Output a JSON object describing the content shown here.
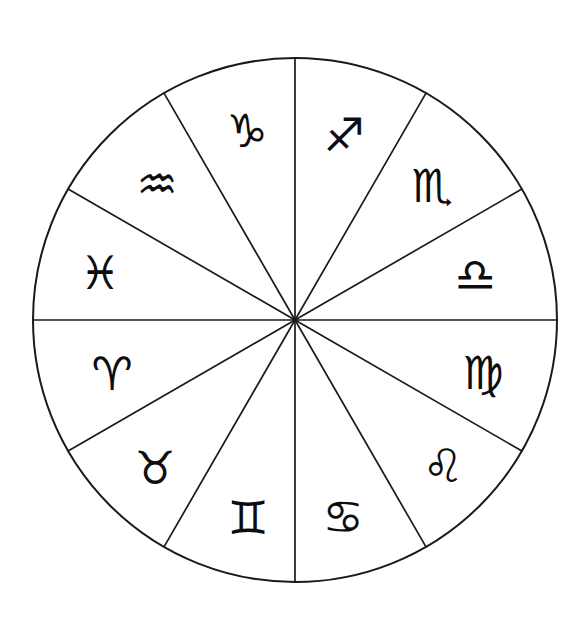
{
  "diagram": {
    "background_color": "#ffffff",
    "line_color": "#1a1a1a",
    "glyph_color": "#0d0d0d",
    "center_x": 295,
    "center_y": 320,
    "radius": 262,
    "segment_count": 12,
    "segment_span_degrees": 30,
    "glyph_radius": 192
  },
  "chart_data": {
    "type": "pie",
    "xlabel": "",
    "ylabel": "",
    "categories": [
      "Sagittarius",
      "Scorpio",
      "Libra",
      "Virgo",
      "Leo",
      "Cancer",
      "Gemini",
      "Taurus",
      "Aries",
      "Pisces",
      "Aquarius",
      "Capricorn"
    ],
    "values": [
      30,
      30,
      30,
      30,
      30,
      30,
      30,
      30,
      30,
      30,
      30,
      30
    ],
    "legend_position": "none",
    "grid": false
  },
  "segments": [
    {
      "name": "Sagittarius",
      "glyph": "♐",
      "icon_name": "sagittarius-archer-icon",
      "start_angle": 270,
      "end_angle": 300,
      "mid_angle": 285,
      "glyph_x": 344,
      "glyph_y": 135,
      "glyph_size": 46,
      "glyph_rotation": 0
    },
    {
      "name": "Scorpio",
      "glyph": "♏",
      "icon_name": "scorpio-scorpion-icon",
      "start_angle": 300,
      "end_angle": 330,
      "mid_angle": 315,
      "glyph_x": 432,
      "glyph_y": 186,
      "glyph_size": 46,
      "glyph_rotation": 0
    },
    {
      "name": "Libra",
      "glyph": "♎",
      "icon_name": "libra-scales-icon",
      "start_angle": 330,
      "end_angle": 360,
      "mid_angle": 345,
      "glyph_x": 475,
      "glyph_y": 275,
      "glyph_size": 46,
      "glyph_rotation": 0
    },
    {
      "name": "Virgo",
      "glyph": "♍",
      "icon_name": "virgo-maiden-icon",
      "start_angle": 0,
      "end_angle": 30,
      "mid_angle": 15,
      "glyph_x": 483,
      "glyph_y": 373,
      "glyph_size": 46,
      "glyph_rotation": 0
    },
    {
      "name": "Leo",
      "glyph": "♌",
      "icon_name": "leo-lion-icon",
      "start_angle": 30,
      "end_angle": 60,
      "mid_angle": 45,
      "glyph_x": 443,
      "glyph_y": 466,
      "glyph_size": 46,
      "glyph_rotation": 0
    },
    {
      "name": "Cancer",
      "glyph": "♋",
      "icon_name": "cancer-crab-icon",
      "start_angle": 60,
      "end_angle": 90,
      "mid_angle": 75,
      "glyph_x": 343,
      "glyph_y": 517,
      "glyph_size": 46,
      "glyph_rotation": 0
    },
    {
      "name": "Gemini",
      "glyph": "♊",
      "icon_name": "gemini-twins-icon",
      "start_angle": 90,
      "end_angle": 120,
      "mid_angle": 105,
      "glyph_x": 248,
      "glyph_y": 518,
      "glyph_size": 44,
      "glyph_rotation": 0
    },
    {
      "name": "Taurus",
      "glyph": "♉",
      "icon_name": "taurus-bull-icon",
      "start_angle": 120,
      "end_angle": 150,
      "mid_angle": 135,
      "glyph_x": 155,
      "glyph_y": 468,
      "glyph_size": 46,
      "glyph_rotation": 0
    },
    {
      "name": "Aries",
      "glyph": "♈",
      "icon_name": "aries-ram-icon",
      "start_angle": 150,
      "end_angle": 180,
      "mid_angle": 165,
      "glyph_x": 112,
      "glyph_y": 374,
      "glyph_size": 46,
      "glyph_rotation": 0
    },
    {
      "name": "Pisces",
      "glyph": "♓",
      "icon_name": "pisces-fishes-icon",
      "start_angle": 180,
      "end_angle": 210,
      "mid_angle": 195,
      "glyph_x": 100,
      "glyph_y": 273,
      "glyph_size": 46,
      "glyph_rotation": 0
    },
    {
      "name": "Aquarius",
      "glyph": "♒",
      "icon_name": "aquarius-waterbearer-icon",
      "start_angle": 210,
      "end_angle": 240,
      "mid_angle": 225,
      "glyph_x": 157,
      "glyph_y": 184,
      "glyph_size": 46,
      "glyph_rotation": 0
    },
    {
      "name": "Capricorn",
      "glyph": "♑",
      "icon_name": "capricorn-goat-icon",
      "start_angle": 240,
      "end_angle": 270,
      "mid_angle": 255,
      "glyph_x": 247,
      "glyph_y": 131,
      "glyph_size": 46,
      "glyph_rotation": 0
    }
  ]
}
